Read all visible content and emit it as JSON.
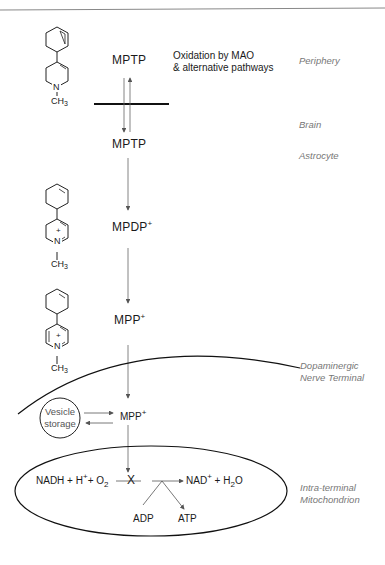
{
  "diagram": {
    "compounds": {
      "mptp_periphery": "MPTP",
      "mptp_brain": "MPTP",
      "mpdp": "MPDP",
      "mpdp_charge": "+",
      "mpp": "MPP",
      "mpp_charge": "+",
      "mpp_terminal": "MPP",
      "mpp_terminal_charge": "+"
    },
    "oxidation_note": {
      "line1": "Oxidation by MAO",
      "line2": "& alternative pathways"
    },
    "regions": {
      "periphery": "Periphery",
      "brain": "Brain",
      "astrocyte": "Astrocyte",
      "nerve_terminal_line1": "Dopaminergic",
      "nerve_terminal_line2": "Nerve Terminal",
      "mitochondrion_line1": "Intra-terminal",
      "mitochondrion_line2": "Mitochondrion"
    },
    "vesicle": {
      "line1": "Vesicle",
      "line2": "storage"
    },
    "structures": {
      "methyl": "CH",
      "methyl_sub": "3",
      "nitrogen": "N",
      "charge": "+"
    },
    "mitochondria_reaction": {
      "reactants_a": "NADH + H",
      "reactants_h_charge": "+",
      "reactants_b": "+ O",
      "reactants_o_sub": "2",
      "block": "X",
      "products_a": "NAD",
      "products_charge": "+",
      "products_b": " + H",
      "products_h_sub": "2",
      "products_c": "O",
      "adp": "ADP",
      "atp": "ATP"
    }
  }
}
